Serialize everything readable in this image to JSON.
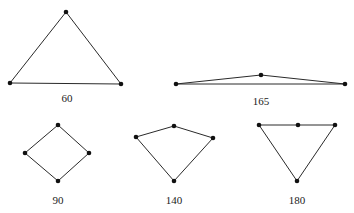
{
  "figures": [
    {
      "label": "60",
      "nodes": [
        [
          66,
          12
        ],
        [
          10,
          83
        ],
        [
          121,
          84
        ]
      ],
      "edges": [
        [
          0,
          1
        ],
        [
          1,
          2
        ],
        [
          2,
          0
        ]
      ],
      "label_pos": [
        67,
        102
      ]
    },
    {
      "label": "165",
      "nodes": [
        [
          176,
          84
        ],
        [
          261,
          75
        ],
        [
          345,
          84
        ]
      ],
      "edges": [
        [
          0,
          1
        ],
        [
          1,
          2
        ],
        [
          0,
          2
        ]
      ],
      "label_pos": [
        261,
        105
      ]
    },
    {
      "label": "90",
      "nodes": [
        [
          58,
          125
        ],
        [
          25,
          153
        ],
        [
          89,
          153
        ],
        [
          58,
          181
        ]
      ],
      "edges": [
        [
          0,
          1
        ],
        [
          0,
          2
        ],
        [
          1,
          3
        ],
        [
          2,
          3
        ]
      ],
      "label_pos": [
        58,
        204
      ]
    },
    {
      "label": "140",
      "nodes": [
        [
          136,
          137
        ],
        [
          174,
          126
        ],
        [
          213,
          138
        ],
        [
          174,
          181
        ]
      ],
      "edges": [
        [
          0,
          1
        ],
        [
          1,
          2
        ],
        [
          2,
          3
        ],
        [
          3,
          0
        ]
      ],
      "label_pos": [
        174,
        204
      ]
    },
    {
      "label": "180",
      "nodes": [
        [
          259,
          125
        ],
        [
          298,
          125
        ],
        [
          335,
          125
        ],
        [
          297,
          181
        ]
      ],
      "edges": [
        [
          0,
          1
        ],
        [
          1,
          2
        ],
        [
          2,
          3
        ],
        [
          3,
          0
        ]
      ],
      "label_pos": [
        297,
        204
      ]
    }
  ],
  "colors": {
    "edge": "#2a2a2a",
    "node": "#111111",
    "text": "#222222"
  }
}
